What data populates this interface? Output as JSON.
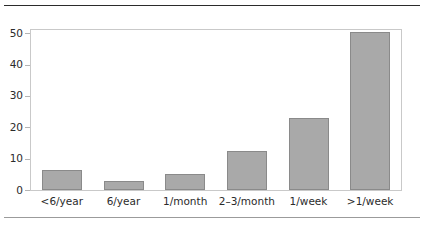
{
  "chart_data": {
    "type": "bar",
    "title": "",
    "subtitle": "",
    "xlabel": "",
    "ylabel": "",
    "categories": [
      "<6/year",
      "6/year",
      "1/month",
      "2–3/month",
      "1/week",
      ">1/week"
    ],
    "values": [
      6.5,
      3,
      5,
      12.5,
      23,
      50.5
    ],
    "series": [
      {
        "name": "",
        "values": [
          6.5,
          3,
          5,
          12.5,
          23,
          50.5
        ]
      }
    ],
    "ylim": [
      0,
      51
    ],
    "xlim": [
      0,
      6
    ],
    "y_ticks": [
      0,
      10,
      20,
      30,
      40,
      50
    ],
    "y_tick_labels": [
      "0",
      "10",
      "20",
      "30",
      "40",
      "50"
    ],
    "grid": false,
    "legend": false,
    "legend_position": "none",
    "annotations": [],
    "colors": {
      "bar_fill": "#a9a9a9",
      "bar_edge": "#8a8a8a",
      "frame": "#c9c9c9",
      "text": "#2b2b2b",
      "rule_top": "#2b2b2b",
      "rule_bottom": "#9b9b9b",
      "background": "#ffffff"
    }
  }
}
